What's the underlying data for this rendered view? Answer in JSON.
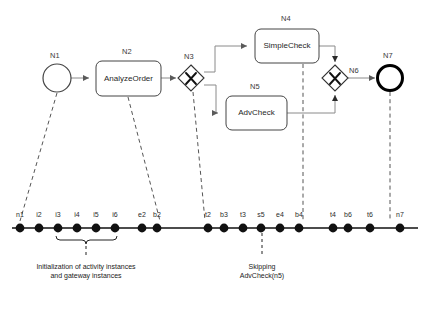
{
  "figure": {
    "background": "#ffffff",
    "stroke": "#4a4a4a",
    "dash_stroke": "#555555",
    "dot_color": "#111111"
  },
  "process": {
    "nodes": [
      {
        "id": "N1",
        "label": "N1",
        "type": "start-event",
        "text": "",
        "x": 57,
        "y": 78,
        "r": 14
      },
      {
        "id": "N2",
        "label": "N2",
        "type": "task",
        "text": "AnalyzeOrder",
        "x": 96,
        "y": 61,
        "w": 65,
        "h": 35
      },
      {
        "id": "N3",
        "label": "N3",
        "type": "exclusive-gateway",
        "text": "",
        "x": 191,
        "y": 78,
        "rx": 13
      },
      {
        "id": "N4",
        "label": "N4",
        "type": "task",
        "text": "SimpleCheck",
        "x": 255,
        "y": 29,
        "w": 64,
        "h": 34
      },
      {
        "id": "N5",
        "label": "N5",
        "type": "task",
        "text": "AdvCheck",
        "x": 226,
        "y": 96,
        "w": 61,
        "h": 34
      },
      {
        "id": "N6",
        "label": "N6",
        "type": "exclusive-gateway",
        "text": "",
        "x": 335,
        "y": 78,
        "rx": 13
      },
      {
        "id": "N7",
        "label": "N7",
        "type": "end-event",
        "text": "",
        "x": 390,
        "y": 78,
        "r": 13
      }
    ]
  },
  "timeline": {
    "axis_y": 228,
    "axis_x_start": 12,
    "axis_x_end": 418,
    "events": [
      {
        "label": "n1",
        "x": 20
      },
      {
        "label": "i2",
        "x": 39
      },
      {
        "label": "i3",
        "x": 58
      },
      {
        "label": "i4",
        "x": 77
      },
      {
        "label": "i5",
        "x": 96
      },
      {
        "label": "i6",
        "x": 115
      },
      {
        "label": "e2",
        "x": 142
      },
      {
        "label": "b2",
        "x": 157
      },
      {
        "label": "t2",
        "x": 208
      },
      {
        "label": "b3",
        "x": 224
      },
      {
        "label": "t3",
        "x": 243
      },
      {
        "label": "s5",
        "x": 261
      },
      {
        "label": "e4",
        "x": 280
      },
      {
        "label": "b4",
        "x": 299
      },
      {
        "label": "t4",
        "x": 333
      },
      {
        "label": "b6",
        "x": 348
      },
      {
        "label": "t6",
        "x": 370
      },
      {
        "label": "n7",
        "x": 400
      }
    ]
  },
  "brace": {
    "x_start": 56,
    "x_end": 117,
    "y": 238,
    "stem_x": 86
  },
  "annotations": [
    {
      "id": "init-caption",
      "line1": "Initialization of activity instances",
      "line2": "and gateway instances",
      "x": 86,
      "y": 266
    },
    {
      "id": "skip-caption",
      "line1": "Skipping",
      "line2": "AdvCheck(n5)",
      "x": 262,
      "y": 266
    }
  ],
  "leaders": [
    {
      "from_node": "N1",
      "x1": 57,
      "y1": 93,
      "x2": 20,
      "y2": 221
    },
    {
      "from_node": "N2",
      "x1": 128,
      "y1": 97,
      "x2": 160,
      "y2": 221
    },
    {
      "from_node": "N3",
      "x1": 193,
      "y1": 92,
      "x2": 205,
      "y2": 221
    },
    {
      "from_node": "N4",
      "x1": 303,
      "y1": 64,
      "x2": 303,
      "y2": 221
    },
    {
      "from_node": "N7",
      "x1": 390,
      "y1": 92,
      "x2": 390,
      "y2": 221
    }
  ]
}
